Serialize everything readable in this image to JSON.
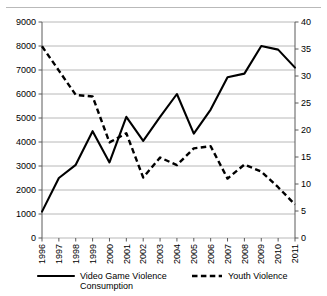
{
  "figure": {
    "clipped_caption_fragment": "",
    "has_top_rule": true
  },
  "chart_data": {
    "type": "line",
    "title": "",
    "xlabel": "",
    "ylabel": "",
    "grid": true,
    "legend_position": "bottom",
    "categories": [
      "1996",
      "1997",
      "1998",
      "1999",
      "2000",
      "2001",
      "2002",
      "2003",
      "2004",
      "2005",
      "2006",
      "2007",
      "2008",
      "2009",
      "2010",
      "2011"
    ],
    "x_tick_rotation": 90,
    "axes": {
      "left": {
        "min": 0,
        "max": 9000,
        "step": 1000,
        "ticks": [
          "0",
          "1000",
          "2000",
          "3000",
          "4000",
          "5000",
          "6000",
          "7000",
          "8000",
          "9000"
        ]
      },
      "right": {
        "min": 0,
        "max": 40,
        "step": 5,
        "ticks": [
          "0",
          "5",
          "10",
          "15",
          "20",
          "25",
          "30",
          "35",
          "40"
        ]
      }
    },
    "series": [
      {
        "name": "Video Game Violence Consumption",
        "axis": "left",
        "style": "solid",
        "color": "#000000",
        "values": [
          1100,
          2500,
          3050,
          4450,
          3150,
          5050,
          4050,
          5050,
          6000,
          4350,
          5350,
          6700,
          6850,
          8000,
          7850,
          7100
        ]
      },
      {
        "name": "Youth Violence",
        "axis": "right",
        "style": "dashed",
        "color": "#000000",
        "values": [
          35.5,
          31.0,
          26.5,
          26.2,
          17.7,
          19.4,
          11.2,
          14.9,
          13.5,
          16.6,
          17.0,
          11.0,
          13.6,
          12.3,
          9.4,
          6.2
        ]
      }
    ],
    "legend": [
      {
        "label": "Video Game Violence Consumption",
        "style": "solid"
      },
      {
        "label": "Youth Violence",
        "style": "dashed"
      }
    ]
  }
}
